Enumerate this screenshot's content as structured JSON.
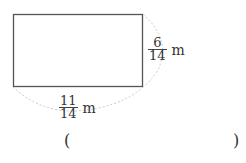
{
  "figure": {
    "shape": "rectangle",
    "width_label": {
      "numerator": "11",
      "denominator": "14",
      "unit": "m"
    },
    "height_label": {
      "numerator": "6",
      "denominator": "14",
      "unit": "m"
    }
  },
  "answer": {
    "open_paren": "(",
    "close_paren": ")",
    "value": ""
  }
}
